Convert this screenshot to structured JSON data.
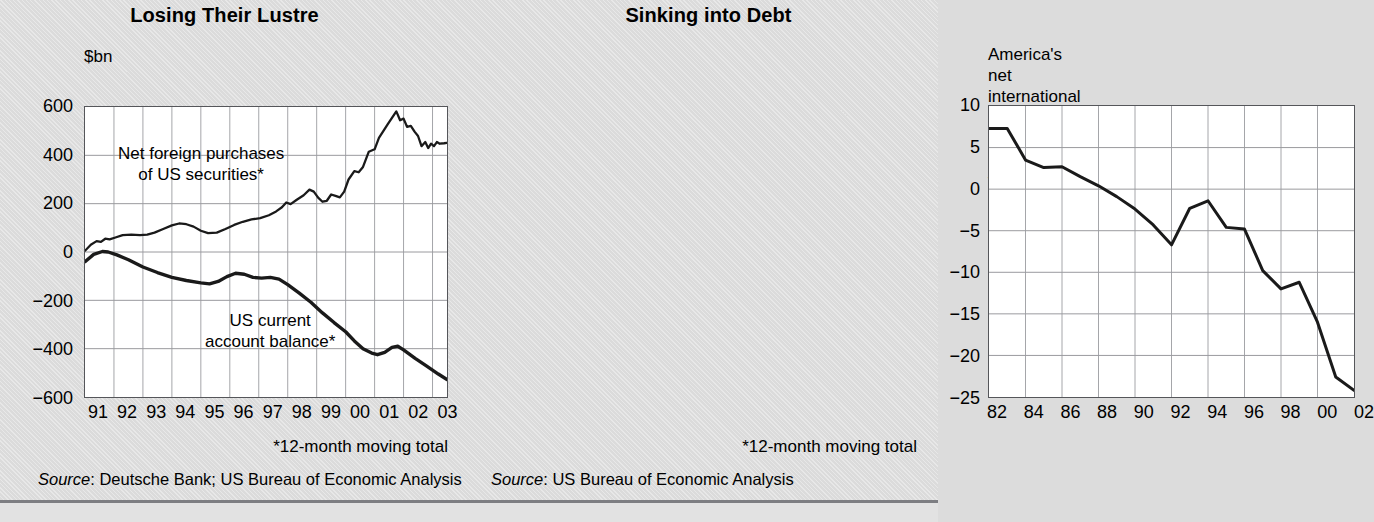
{
  "figure": {
    "background_color": "#dbdbdb",
    "plot_background_color": "#ffffff",
    "line_color": "#1a1a1a",
    "grid_color": "#8d8e92",
    "bottom_rule_color": "#7d7e82"
  },
  "left": {
    "title": "Losing Their Lustre",
    "unit_label": "$bn",
    "annotation_purchases": "Net foreign purchases\nof US securities*",
    "annotation_balance": "US current\naccount balance*",
    "footnote": "*12-month moving total",
    "source_prefix": "Source",
    "source_text": ": Deutsche Bank; US Bureau of Economic Analysis"
  },
  "right": {
    "title": "Sinking into Debt",
    "unit_label": "America's net international investment position\nat market value, as % of GDP",
    "footnote": "*12-month moving total",
    "source_prefix": "Source",
    "source_text": ": US Bureau of Economic Analysis"
  },
  "chart_data": [
    {
      "type": "line",
      "title": "Losing Their Lustre",
      "xlabel": "",
      "ylabel": "$bn",
      "ylim": [
        -600,
        600
      ],
      "yticks": [
        600,
        400,
        200,
        0,
        -200,
        -400,
        -600
      ],
      "ytick_labels": [
        "600",
        "400",
        "200",
        "0",
        "−200",
        "−400",
        "−600"
      ],
      "xlim": [
        1991,
        2003.5
      ],
      "xticks": [
        1991,
        1992,
        1993,
        1994,
        1995,
        1996,
        1997,
        1998,
        1999,
        2000,
        2001,
        2002,
        2003
      ],
      "xtick_labels": [
        "91",
        "92",
        "93",
        "94",
        "95",
        "96",
        "97",
        "98",
        "99",
        "00",
        "01",
        "02",
        "03"
      ],
      "grid": true,
      "legend": "annotations",
      "series": [
        {
          "name": "Net foreign purchases of US securities*",
          "points": [
            [
              1991.0,
              5
            ],
            [
              1991.2,
              30
            ],
            [
              1991.4,
              45
            ],
            [
              1991.55,
              42
            ],
            [
              1991.7,
              55
            ],
            [
              1991.85,
              52
            ],
            [
              1992.05,
              60
            ],
            [
              1992.3,
              70
            ],
            [
              1992.6,
              72
            ],
            [
              1992.9,
              70
            ],
            [
              1993.15,
              72
            ],
            [
              1993.4,
              80
            ],
            [
              1993.7,
              95
            ],
            [
              1994.0,
              110
            ],
            [
              1994.25,
              118
            ],
            [
              1994.5,
              115
            ],
            [
              1994.75,
              105
            ],
            [
              1995.0,
              88
            ],
            [
              1995.25,
              78
            ],
            [
              1995.55,
              80
            ],
            [
              1995.85,
              95
            ],
            [
              1996.15,
              112
            ],
            [
              1996.45,
              125
            ],
            [
              1996.75,
              135
            ],
            [
              1997.05,
              140
            ],
            [
              1997.35,
              152
            ],
            [
              1997.6,
              168
            ],
            [
              1997.8,
              185
            ],
            [
              1997.95,
              205
            ],
            [
              1998.1,
              198
            ],
            [
              1998.3,
              215
            ],
            [
              1998.55,
              235
            ],
            [
              1998.75,
              258
            ],
            [
              1998.9,
              250
            ],
            [
              1999.05,
              225
            ],
            [
              1999.2,
              208
            ],
            [
              1999.35,
              212
            ],
            [
              1999.5,
              238
            ],
            [
              1999.65,
              232
            ],
            [
              1999.8,
              226
            ],
            [
              1999.95,
              250
            ],
            [
              2000.1,
              300
            ],
            [
              2000.3,
              335
            ],
            [
              2000.45,
              330
            ],
            [
              2000.6,
              352
            ],
            [
              2000.8,
              415
            ],
            [
              2001.0,
              425
            ],
            [
              2001.15,
              472
            ],
            [
              2001.3,
              500
            ],
            [
              2001.45,
              528
            ],
            [
              2001.6,
              555
            ],
            [
              2001.75,
              582
            ],
            [
              2001.88,
              545
            ],
            [
              2002.0,
              552
            ],
            [
              2002.12,
              518
            ],
            [
              2002.25,
              522
            ],
            [
              2002.38,
              498
            ],
            [
              2002.5,
              480
            ],
            [
              2002.62,
              438
            ],
            [
              2002.75,
              455
            ],
            [
              2002.85,
              430
            ],
            [
              2002.95,
              448
            ],
            [
              2003.05,
              438
            ],
            [
              2003.15,
              455
            ],
            [
              2003.25,
              448
            ],
            [
              2003.4,
              450
            ],
            [
              2003.5,
              452
            ]
          ]
        },
        {
          "name": "US current account balance*",
          "points": [
            [
              1991.0,
              -40
            ],
            [
              1991.3,
              -10
            ],
            [
              1991.6,
              2
            ],
            [
              1991.8,
              0
            ],
            [
              1992.1,
              -12
            ],
            [
              1992.5,
              -32
            ],
            [
              1993.0,
              -62
            ],
            [
              1993.5,
              -85
            ],
            [
              1994.0,
              -105
            ],
            [
              1994.5,
              -118
            ],
            [
              1995.0,
              -128
            ],
            [
              1995.3,
              -132
            ],
            [
              1995.6,
              -122
            ],
            [
              1995.9,
              -102
            ],
            [
              1996.2,
              -88
            ],
            [
              1996.5,
              -92
            ],
            [
              1996.8,
              -105
            ],
            [
              1997.1,
              -108
            ],
            [
              1997.4,
              -105
            ],
            [
              1997.7,
              -112
            ],
            [
              1998.0,
              -135
            ],
            [
              1998.4,
              -170
            ],
            [
              1998.8,
              -208
            ],
            [
              1999.2,
              -252
            ],
            [
              1999.6,
              -292
            ],
            [
              2000.0,
              -330
            ],
            [
              2000.3,
              -368
            ],
            [
              2000.6,
              -400
            ],
            [
              2000.9,
              -418
            ],
            [
              2001.1,
              -425
            ],
            [
              2001.35,
              -415
            ],
            [
              2001.6,
              -395
            ],
            [
              2001.8,
              -390
            ],
            [
              2002.0,
              -405
            ],
            [
              2002.4,
              -440
            ],
            [
              2002.8,
              -472
            ],
            [
              2003.2,
              -505
            ],
            [
              2003.5,
              -528
            ]
          ]
        }
      ]
    },
    {
      "type": "line",
      "title": "Sinking into Debt",
      "xlabel": "",
      "ylabel": "America's net international investment position at market value, as % of GDP",
      "ylim": [
        -25,
        10
      ],
      "yticks": [
        10,
        5,
        0,
        -5,
        -10,
        -15,
        -20,
        -25
      ],
      "ytick_labels": [
        "10",
        "5",
        "0",
        "−5",
        "−10",
        "−15",
        "−20",
        "−25"
      ],
      "xlim": [
        1982,
        2002
      ],
      "xticks": [
        1982,
        1984,
        1986,
        1988,
        1990,
        1992,
        1994,
        1996,
        1998,
        2000,
        2002
      ],
      "xtick_labels": [
        "82",
        "84",
        "86",
        "88",
        "90",
        "92",
        "94",
        "96",
        "98",
        "00",
        "02"
      ],
      "grid": true,
      "series": [
        {
          "name": "America's net international investment position (% of GDP)",
          "x": [
            1982,
            1983,
            1984,
            1985,
            1986,
            1987,
            1988,
            1989,
            1990,
            1991,
            1992,
            1993,
            1994,
            1995,
            1996,
            1997,
            1998,
            1999,
            2000,
            2001,
            2002
          ],
          "values": [
            7.3,
            7.3,
            3.5,
            2.6,
            2.7,
            1.5,
            0.4,
            -0.9,
            -2.4,
            -4.3,
            -6.7,
            -2.3,
            -1.4,
            -4.6,
            -4.8,
            -9.8,
            -12.0,
            -11.2,
            -16.0,
            -22.6,
            -24.2
          ]
        }
      ]
    }
  ]
}
